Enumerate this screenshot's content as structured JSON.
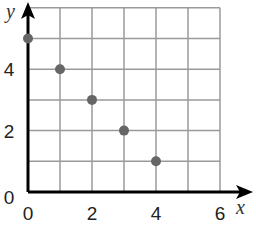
{
  "chart_data": {
    "type": "scatter",
    "title": "",
    "xlabel": "x",
    "ylabel": "y",
    "xlim": [
      0,
      6
    ],
    "ylim": [
      0,
      6
    ],
    "grid": true,
    "grid_step": 1,
    "x_tick_labels": [
      "0",
      "2",
      "4",
      "6"
    ],
    "y_tick_labels": [
      "0",
      "2",
      "4"
    ],
    "series": [
      {
        "name": "points",
        "color": "#666666",
        "points": [
          {
            "x": 0,
            "y": 5
          },
          {
            "x": 1,
            "y": 4
          },
          {
            "x": 2,
            "y": 3
          },
          {
            "x": 3,
            "y": 2
          },
          {
            "x": 4,
            "y": 1
          }
        ]
      }
    ]
  },
  "colors": {
    "grid": "#9a9a9a",
    "axis": "#000000",
    "point": "#666666"
  }
}
